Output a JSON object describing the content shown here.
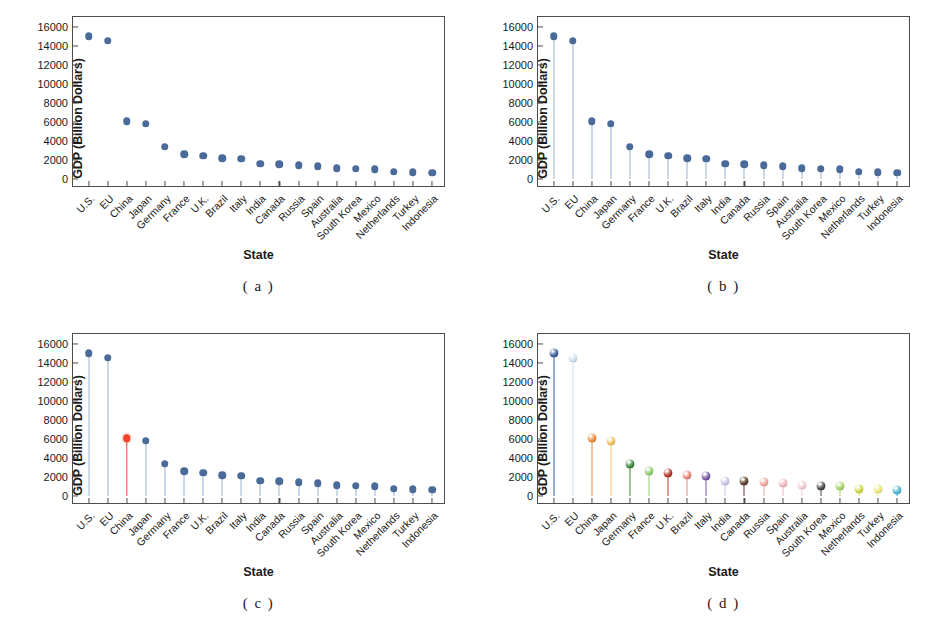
{
  "figure": {
    "width": 931,
    "height": 634,
    "background": "#ffffff"
  },
  "chart_data": [
    {
      "panel": "a",
      "caption": "( a )",
      "type": "scatter",
      "title": "",
      "xlabel": "State",
      "ylabel": "GDP (Billion Dollars)",
      "categories": [
        "U.S.",
        "EU",
        "China",
        "Japan",
        "Germany",
        "France",
        "U.K.",
        "Brazil",
        "Italy",
        "India",
        "Canada",
        "Russia",
        "Spain",
        "Australia",
        "South Korea",
        "Mexico",
        "Netherlands",
        "Turkey",
        "Indonesia"
      ],
      "values": [
        15000,
        14500,
        6100,
        5800,
        3400,
        2650,
        2500,
        2200,
        2150,
        1650,
        1600,
        1500,
        1400,
        1150,
        1120,
        1050,
        800,
        740,
        700
      ],
      "yticks": [
        0,
        2000,
        4000,
        6000,
        8000,
        10000,
        12000,
        14000,
        16000
      ],
      "ylim": [
        -900,
        17000
      ],
      "grid": false,
      "legend": "none",
      "marker_color": "#4a6a9a",
      "stems": false
    },
    {
      "panel": "b",
      "caption": "( b )",
      "type": "scatter",
      "title": "",
      "xlabel": "State",
      "ylabel": "GDP (Billion Dollars)",
      "categories": [
        "U.S.",
        "EU",
        "China",
        "Japan",
        "Germany",
        "France",
        "U.K.",
        "Brazil",
        "Italy",
        "India",
        "Canada",
        "Russia",
        "Spain",
        "Australia",
        "South Korea",
        "Mexico",
        "Netherlands",
        "Turkey",
        "Indonesia"
      ],
      "values": [
        15000,
        14500,
        6100,
        5800,
        3400,
        2650,
        2500,
        2200,
        2150,
        1650,
        1600,
        1500,
        1400,
        1150,
        1120,
        1050,
        800,
        740,
        700
      ],
      "yticks": [
        0,
        2000,
        4000,
        6000,
        8000,
        10000,
        12000,
        14000,
        16000
      ],
      "ylim": [
        -900,
        17000
      ],
      "grid": false,
      "legend": "none",
      "marker_color": "#4a6a9a",
      "stem_color": "#9ab3d4",
      "stems": true
    },
    {
      "panel": "c",
      "caption": "( c )",
      "type": "scatter",
      "title": "",
      "xlabel": "State",
      "ylabel": "GDP (Billion Dollars)",
      "categories": [
        "U.S.",
        "EU",
        "China",
        "Japan",
        "Germany",
        "France",
        "U.K.",
        "Brazil",
        "Italy",
        "India",
        "Canada",
        "Russia",
        "Spain",
        "Australia",
        "South Korea",
        "Mexico",
        "Netherlands",
        "Turkey",
        "Indonesia"
      ],
      "values": [
        15000,
        14500,
        6100,
        5800,
        3400,
        2650,
        2500,
        2200,
        2150,
        1650,
        1600,
        1500,
        1400,
        1150,
        1120,
        1050,
        800,
        740,
        700
      ],
      "yticks": [
        0,
        2000,
        4000,
        6000,
        8000,
        10000,
        12000,
        14000,
        16000
      ],
      "ylim": [
        -900,
        17000
      ],
      "grid": false,
      "legend": "none",
      "marker_color": "#4a6a9a",
      "stem_color": "#9ab3d4",
      "stems": true,
      "highlight_index": 2,
      "highlight_label": "China",
      "highlight_color": "#f0452a"
    },
    {
      "panel": "d",
      "caption": "( d )",
      "type": "scatter",
      "title": "",
      "xlabel": "State",
      "ylabel": "GDP (Billion Dollars)",
      "categories": [
        "U.S.",
        "EU",
        "China",
        "Japan",
        "Germany",
        "France",
        "U.K.",
        "Brazil",
        "Italy",
        "India",
        "Canada",
        "Russia",
        "Spain",
        "Australia",
        "South Korea",
        "Mexico",
        "Netherlands",
        "Turkey",
        "Indonesia"
      ],
      "values": [
        15000,
        14500,
        6100,
        5800,
        3400,
        2650,
        2500,
        2200,
        2150,
        1650,
        1600,
        1500,
        1400,
        1150,
        1120,
        1050,
        800,
        740,
        700
      ],
      "yticks": [
        0,
        2000,
        4000,
        6000,
        8000,
        10000,
        12000,
        14000,
        16000
      ],
      "ylim": [
        -900,
        17000
      ],
      "grid": false,
      "legend": "none",
      "stems": true,
      "marker_colors": [
        "#3b5fa0",
        "#cfe0f2",
        "#ef8c3b",
        "#eec464",
        "#3f8a3f",
        "#8fcf72",
        "#b33a2e",
        "#e8897c",
        "#7a5ba8",
        "#cfc6e8",
        "#5a3f2e",
        "#f0a898",
        "#f4b8c4",
        "#f6cdd3",
        "#4a4a4a",
        "#a9d468",
        "#cfd94a",
        "#ece97a",
        "#4fb8d4"
      ]
    }
  ]
}
